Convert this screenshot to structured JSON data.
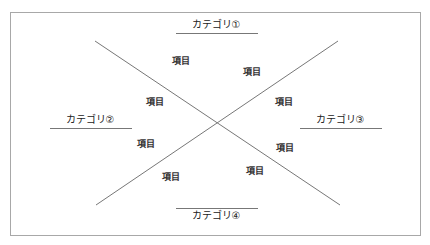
{
  "diagram": {
    "type": "cross-quadrant",
    "categories": [
      {
        "id": 1,
        "label": "カテゴリ①",
        "position": "top"
      },
      {
        "id": 2,
        "label": "カテゴリ②",
        "position": "left"
      },
      {
        "id": 3,
        "label": "カテゴリ③",
        "position": "right"
      },
      {
        "id": 4,
        "label": "カテゴリ④",
        "position": "bottom"
      }
    ],
    "items": [
      {
        "label": "項目",
        "region": "top"
      },
      {
        "label": "項目",
        "region": "top"
      },
      {
        "label": "項目",
        "region": "left"
      },
      {
        "label": "項目",
        "region": "right"
      },
      {
        "label": "項目",
        "region": "left"
      },
      {
        "label": "項目",
        "region": "right"
      },
      {
        "label": "項目",
        "region": "bottom"
      },
      {
        "label": "項目",
        "region": "bottom"
      }
    ],
    "colors": {
      "border": "#a8a8a8",
      "lines": "#777777",
      "text": "#222222"
    }
  }
}
